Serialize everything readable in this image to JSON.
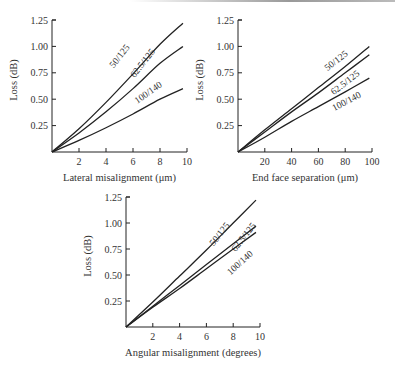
{
  "chart_data": [
    {
      "type": "line",
      "title": "",
      "xlabel": "Lateral misalignment (μm)",
      "ylabel": "Loss (dB)",
      "xlim": [
        0,
        10
      ],
      "ylim": [
        0,
        1.25
      ],
      "xticks": [
        "2",
        "4",
        "6",
        "8",
        "10"
      ],
      "yticks": [
        "0.25",
        "0.50",
        "0.75",
        "1.00",
        "1.25"
      ],
      "grid": false,
      "legend": "inline labels",
      "x": [
        0,
        2,
        4,
        6,
        8,
        9.7
      ],
      "series": [
        {
          "name": "50/125",
          "values": [
            0,
            0.22,
            0.47,
            0.74,
            1.02,
            1.22
          ]
        },
        {
          "name": "62.5/125",
          "values": [
            0,
            0.18,
            0.38,
            0.6,
            0.84,
            1.0
          ]
        },
        {
          "name": "100/140",
          "values": [
            0,
            0.11,
            0.23,
            0.36,
            0.5,
            0.6
          ]
        }
      ]
    },
    {
      "type": "line",
      "title": "",
      "xlabel": "End face separation (μm)",
      "ylabel": "Loss (dB)",
      "xlim": [
        0,
        100
      ],
      "ylim": [
        0,
        1.25
      ],
      "xticks": [
        "20",
        "40",
        "60",
        "80",
        "100"
      ],
      "yticks": [
        "0.25",
        "0.50",
        "0.75",
        "1.00",
        "1.25"
      ],
      "grid": false,
      "legend": "inline labels",
      "x": [
        0,
        20,
        40,
        60,
        80,
        98
      ],
      "series": [
        {
          "name": "50/125",
          "values": [
            0,
            0.21,
            0.41,
            0.61,
            0.81,
            1.0
          ]
        },
        {
          "name": "62.5/125",
          "values": [
            0,
            0.19,
            0.38,
            0.56,
            0.75,
            0.92
          ]
        },
        {
          "name": "100/140",
          "values": [
            0,
            0.14,
            0.29,
            0.43,
            0.57,
            0.7
          ]
        }
      ]
    },
    {
      "type": "line",
      "title": "",
      "xlabel": "Angular misalignment (degrees)",
      "ylabel": "Loss (dB)",
      "xlim": [
        0,
        10
      ],
      "ylim": [
        0,
        1.25
      ],
      "xticks": [
        "2",
        "4",
        "6",
        "8",
        "10"
      ],
      "yticks": [
        "0.25",
        "0.50",
        "0.75",
        "1.00",
        "1.25"
      ],
      "grid": false,
      "legend": "inline labels",
      "x": [
        0,
        2,
        4,
        6,
        8,
        9.7
      ],
      "series": [
        {
          "name": "50/125",
          "values": [
            0,
            0.24,
            0.49,
            0.74,
            1.0,
            1.22
          ]
        },
        {
          "name": "62.5/125",
          "values": [
            0,
            0.2,
            0.4,
            0.6,
            0.8,
            0.97
          ]
        },
        {
          "name": "100/140",
          "values": [
            0,
            0.19,
            0.37,
            0.56,
            0.75,
            0.91
          ]
        }
      ]
    }
  ]
}
